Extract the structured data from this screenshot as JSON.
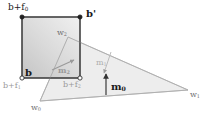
{
  "figure": {
    "background_color": "#ffffff",
    "line_color_dark": "#2b2b2b",
    "line_color_light": "#b9b9b9",
    "fill_square": "#d9d9d9",
    "fill_triangle": "#ececec"
  },
  "labels": {
    "b_plus_f0": {
      "text": "b+f",
      "sub": "0",
      "x": 8,
      "y": 3,
      "weight": "normal",
      "tone": "dark"
    },
    "b_prime": {
      "text": "b'",
      "sub": "",
      "x": 86,
      "y": 9,
      "weight": "bold",
      "tone": "dark"
    },
    "w2": {
      "text": "w",
      "sub": "2",
      "x": 57,
      "y": 29,
      "weight": "normal",
      "tone": "mid"
    },
    "b": {
      "text": "b",
      "sub": "",
      "x": 25,
      "y": 69,
      "weight": "bold",
      "tone": "dark"
    },
    "b_plus_f1": {
      "text": "b+f",
      "sub": "1",
      "x": 3,
      "y": 82,
      "weight": "normal",
      "tone": "light"
    },
    "b_plus_f2": {
      "text": "b+f",
      "sub": "2",
      "x": 63,
      "y": 81,
      "weight": "normal",
      "tone": "light"
    },
    "m2": {
      "text": "m",
      "sub": "2",
      "x": 58,
      "y": 66,
      "weight": "bold",
      "tone": "light"
    },
    "m1": {
      "text": "m",
      "sub": "1",
      "x": 96,
      "y": 60,
      "weight": "normal",
      "tone": "light"
    },
    "m0": {
      "text": "m",
      "sub": "0",
      "x": 111,
      "y": 83,
      "weight": "bold",
      "tone": "dark"
    },
    "w0": {
      "text": "w",
      "sub": "0",
      "x": 31,
      "y": 105,
      "weight": "normal",
      "tone": "mid"
    },
    "w1": {
      "text": "w",
      "sub": "1",
      "x": 190,
      "y": 92,
      "weight": "normal",
      "tone": "mid"
    }
  },
  "geometry": {
    "square": {
      "x1": 22,
      "y1": 17,
      "x2": 80,
      "y2": 78
    },
    "triangle": {
      "w0": [
        40,
        101
      ],
      "w1": [
        188,
        90
      ],
      "w2": [
        68,
        37
      ]
    },
    "vertex_markers": [
      {
        "name": "b-plus-f0-vertex",
        "x": 22,
        "y": 17,
        "filled": true
      },
      {
        "name": "b-prime-vertex",
        "x": 80,
        "y": 17,
        "filled": true
      },
      {
        "name": "b-vertex",
        "x": 22,
        "y": 78,
        "filled": false
      },
      {
        "name": "b-plus-f2-vertex",
        "x": 80,
        "y": 78,
        "filled": false
      }
    ],
    "arrows": [
      {
        "name": "m2-arrow",
        "x1": 52,
        "y1": 70,
        "x2": 74,
        "y2": 60
      },
      {
        "name": "m1-arrow",
        "x1": 110,
        "y1": 53,
        "x2": 104,
        "y2": 72
      },
      {
        "name": "m0-arrow",
        "x1": 106,
        "y1": 94,
        "x2": 106,
        "y2": 74
      }
    ]
  }
}
